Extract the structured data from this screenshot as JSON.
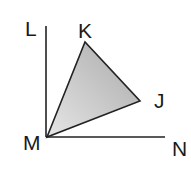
{
  "diagram": {
    "type": "geometry-figure",
    "colors": {
      "stroke": "#222222",
      "fill_light": "#e6e6e6",
      "fill_dark": "#a9a9a9"
    },
    "points": {
      "L": {
        "label": "L"
      },
      "K": {
        "label": "K"
      },
      "J": {
        "label": "J"
      },
      "M": {
        "label": "M"
      },
      "N": {
        "label": "N"
      }
    },
    "rays": [
      {
        "from": "M",
        "to": "L"
      },
      {
        "from": "M",
        "to": "N"
      }
    ],
    "triangle": {
      "vertices": [
        "M",
        "K",
        "J"
      ],
      "shaded": true
    }
  }
}
